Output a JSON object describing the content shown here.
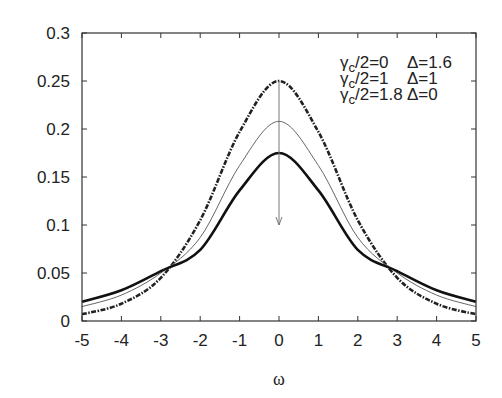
{
  "chart_data": {
    "type": "line",
    "title": "",
    "xlabel": "ω",
    "ylabel": "",
    "xlim": [
      -5,
      5
    ],
    "ylim": [
      0,
      0.3
    ],
    "grid": false,
    "x_ticks": [
      "-5",
      "-4",
      "-3",
      "-2",
      "-1",
      "0",
      "1",
      "2",
      "3",
      "4",
      "5"
    ],
    "y_ticks": [
      "0",
      "0.05",
      "0.1",
      "0.15",
      "0.2",
      "0.25",
      "0.3"
    ],
    "legend_position": "upper right (text only)",
    "x": [
      -5,
      -4,
      -3,
      -2,
      -1,
      0,
      1,
      2,
      3,
      4,
      5
    ],
    "series": [
      {
        "name": "γc/2=0  Δ=1.6",
        "style": "dash-dot thick",
        "values": [
          0.007,
          0.018,
          0.045,
          0.105,
          0.197,
          0.25,
          0.197,
          0.105,
          0.045,
          0.018,
          0.007
        ]
      },
      {
        "name": "γc/2=1  Δ=1",
        "style": "thin solid",
        "values": [
          0.015,
          0.027,
          0.05,
          0.087,
          0.162,
          0.208,
          0.162,
          0.087,
          0.05,
          0.027,
          0.015
        ]
      },
      {
        "name": "γc/2=1.8  Δ=0",
        "style": "thick solid",
        "values": [
          0.02,
          0.032,
          0.052,
          0.074,
          0.136,
          0.175,
          0.136,
          0.074,
          0.052,
          0.032,
          0.02
        ]
      }
    ],
    "annotations": [
      {
        "type": "arrow",
        "from": [
          0,
          0.25
        ],
        "to": [
          0,
          0.1
        ],
        "note": "vertical arrow pointing down at ω=0"
      }
    ]
  },
  "legend": {
    "rows": [
      {
        "gamma": "γ",
        "sub": "c",
        "rest": "/2=0",
        "delta": "Δ=1.6"
      },
      {
        "gamma": "γ",
        "sub": "c",
        "rest": "/2=1",
        "delta": "Δ=1"
      },
      {
        "gamma": "γ",
        "sub": "c",
        "rest": "/2=1.8",
        "delta": "Δ=0"
      }
    ]
  }
}
